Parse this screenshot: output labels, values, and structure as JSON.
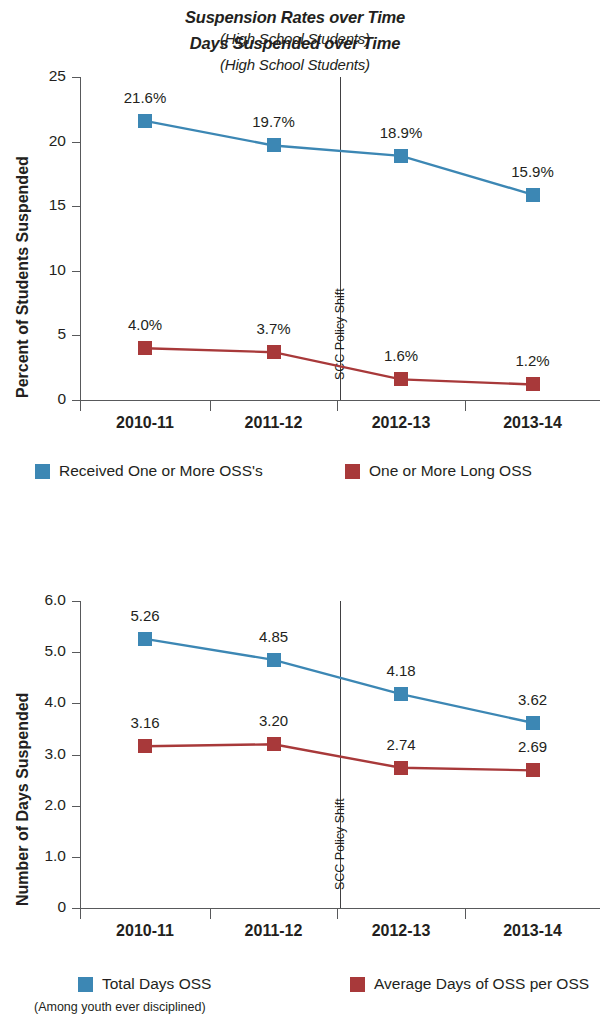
{
  "colors": {
    "blue": "#3c87b4",
    "red": "#a8393a",
    "axis": "#58595b",
    "text": "#231f20"
  },
  "charts": [
    {
      "title": "Suspension Rates over Time",
      "subtitle": "(High School Students)",
      "ylabel": "Percent of Students Suspended",
      "annotation": "SCC Policy Shift",
      "legend": [
        {
          "label": "Received One or More OSS's",
          "color": "#3c87b4"
        },
        {
          "label": "One or More Long OSS",
          "color": "#a8393a"
        }
      ],
      "footnote": "",
      "chart_data": {
        "type": "line",
        "title": "Suspension Rates over Time",
        "subtitle": "(High School Students)",
        "xlabel": "",
        "ylabel": "Percent of Students Suspended",
        "categories": [
          "2010-11",
          "2011-12",
          "2012-13",
          "2013-14"
        ],
        "ylim": [
          0,
          25
        ],
        "yticks": [
          "0",
          "5",
          "10",
          "15",
          "20",
          "25"
        ],
        "ytickvals": [
          0,
          5,
          10,
          15,
          20,
          25
        ],
        "grid": false,
        "legend_position": "bottom",
        "annotations": [
          {
            "text": "SCC Policy Shift",
            "between": [
              "2011-12",
              "2012-13"
            ]
          }
        ],
        "series": [
          {
            "name": "Received One or More OSS's",
            "color": "#3c87b4",
            "values": [
              21.6,
              19.7,
              18.9,
              15.9
            ],
            "labels": [
              "21.6%",
              "19.7%",
              "18.9%",
              "15.9%"
            ]
          },
          {
            "name": "One or More Long OSS",
            "color": "#a8393a",
            "values": [
              4.0,
              3.7,
              1.6,
              1.2
            ],
            "labels": [
              "4.0%",
              "3.7%",
              "1.6%",
              "1.2%"
            ]
          }
        ]
      }
    },
    {
      "title": "Days Suspended over Time",
      "subtitle": "(High School Students)",
      "ylabel": "Number of Days Suspended",
      "annotation": "SCC Policy Shift",
      "legend": [
        {
          "label": "Total Days OSS",
          "color": "#3c87b4"
        },
        {
          "label": "Average Days of OSS per OSS",
          "color": "#a8393a"
        }
      ],
      "footnote": "(Among youth ever disciplined)",
      "chart_data": {
        "type": "line",
        "title": "Days Suspended over Time",
        "subtitle": "(High School Students)",
        "xlabel": "",
        "ylabel": "Number of Days Suspended",
        "categories": [
          "2010-11",
          "2011-12",
          "2012-13",
          "2013-14"
        ],
        "ylim": [
          0,
          6
        ],
        "yticks": [
          "0",
          "1.0",
          "2.0",
          "3.0",
          "4.0",
          "5.0",
          "6.0"
        ],
        "ytickvals": [
          0,
          1,
          2,
          3,
          4,
          5,
          6
        ],
        "grid": false,
        "legend_position": "bottom",
        "annotations": [
          {
            "text": "SCC Policy Shift",
            "between": [
              "2011-12",
              "2012-13"
            ]
          }
        ],
        "series": [
          {
            "name": "Total Days OSS",
            "color": "#3c87b4",
            "values": [
              5.26,
              4.85,
              4.18,
              3.62
            ],
            "labels": [
              "5.26",
              "4.85",
              "4.18",
              "3.62"
            ]
          },
          {
            "name": "Average Days of OSS per OSS",
            "color": "#a8393a",
            "values": [
              3.16,
              3.2,
              2.74,
              2.69
            ],
            "labels": [
              "3.16",
              "3.20",
              "2.74",
              "2.69"
            ]
          }
        ]
      }
    }
  ]
}
